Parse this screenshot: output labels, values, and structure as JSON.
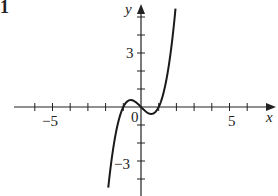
{
  "panel_label": "1",
  "chart_data": {
    "type": "line",
    "title": "",
    "xlabel": "x",
    "ylabel": "y",
    "x_tick_labels": [
      "−5",
      "5"
    ],
    "y_tick_labels": [
      "3",
      "−3"
    ],
    "origin_label": "0",
    "xlim": [
      -7,
      7.5
    ],
    "ylim": [
      -5,
      6
    ],
    "x_ticks": [
      -6,
      -5,
      -4,
      -3,
      -2,
      -1,
      1,
      2,
      3,
      4,
      5,
      6
    ],
    "y_ticks": [
      -5,
      -4,
      -3,
      -2,
      -1,
      1,
      2,
      3,
      4,
      5
    ],
    "grid": false,
    "series": [
      {
        "name": "f(x) ≈ x³ − x",
        "x": [
          -1.85,
          -1.5,
          -1.0,
          -0.58,
          0,
          0.58,
          1.0,
          1.5,
          1.95
        ],
        "y": [
          -4.5,
          -1.88,
          0,
          0.38,
          0,
          -0.38,
          0,
          1.88,
          5.46
        ]
      }
    ],
    "colors": {
      "axis": "#222222",
      "curve": "#1a1a1a"
    }
  }
}
